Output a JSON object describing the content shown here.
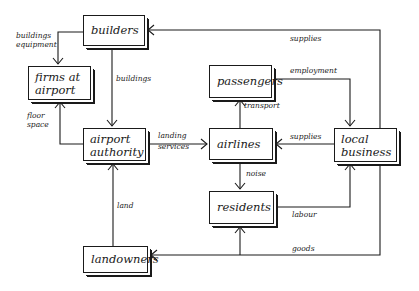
{
  "nodes": {
    "builders": "builders",
    "firms_at_airport": [
      "firms at",
      "airport"
    ],
    "airport_authority": [
      "airport",
      "authority"
    ],
    "passengers": "passengers",
    "airlines": "airlines",
    "local_business": [
      "local",
      "business"
    ],
    "residents": "residents",
    "landowners": "landowners"
  },
  "edges": {
    "builders_to_firms": [
      "buildings",
      "equipment"
    ],
    "builders_to_authority": "buildings",
    "authority_to_firms": [
      "floor",
      "space"
    ],
    "authority_to_airlines": [
      "landing",
      "services"
    ],
    "landowners_to_authority": "land",
    "airlines_to_passengers": "transport",
    "passengers_to_local_business": "employment",
    "local_business_to_airlines": "supplies",
    "local_business_to_builders": "supplies",
    "airlines_to_residents": "noise",
    "residents_to_local_business": "labour",
    "local_business_to_residents_landowners": "goods"
  },
  "colors": {
    "ink": "#1a1a1a",
    "background": "#ffffff"
  }
}
